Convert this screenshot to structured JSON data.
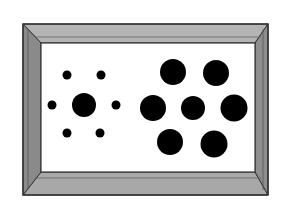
{
  "figure": {
    "type": "ebbinghaus-illusion",
    "frame": {
      "outer": {
        "x": 23,
        "y": 24,
        "w": 245,
        "h": 171
      },
      "inner": {
        "x": 41,
        "y": 43,
        "w": 214,
        "h": 129
      },
      "colors": {
        "top": "#b4b4b4",
        "bottom": "#a8a8a8",
        "left": "#8a8a8a",
        "right": "#8e8e8e",
        "stroke": "#333333",
        "inner_bg": "#ffffff"
      }
    },
    "left_group": {
      "center": {
        "cx": 84,
        "cy": 105,
        "r": 12
      },
      "surround": [
        {
          "cx": 67,
          "cy": 75,
          "r": 4.5
        },
        {
          "cx": 101,
          "cy": 75,
          "r": 4.5
        },
        {
          "cx": 52,
          "cy": 105,
          "r": 4.5
        },
        {
          "cx": 116,
          "cy": 105,
          "r": 4.5
        },
        {
          "cx": 67,
          "cy": 133,
          "r": 4.5
        },
        {
          "cx": 100,
          "cy": 133,
          "r": 4.5
        }
      ]
    },
    "right_group": {
      "center": {
        "cx": 193,
        "cy": 108,
        "r": 12
      },
      "surround": [
        {
          "cx": 173,
          "cy": 72,
          "r": 13
        },
        {
          "cx": 216,
          "cy": 73,
          "r": 13
        },
        {
          "cx": 153,
          "cy": 108,
          "r": 13
        },
        {
          "cx": 234,
          "cy": 108,
          "r": 13.5
        },
        {
          "cx": 170,
          "cy": 142,
          "r": 13
        },
        {
          "cx": 214,
          "cy": 144,
          "r": 13.5
        }
      ]
    },
    "dot_color": "#000000"
  }
}
